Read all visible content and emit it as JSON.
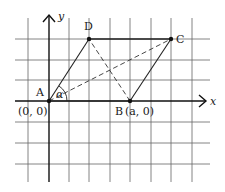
{
  "diagram": {
    "type": "parallelogram-on-coordinate-grid",
    "axes": {
      "x_label": "x",
      "y_label": "y"
    },
    "points": {
      "A": {
        "name": "A",
        "coord_label": "(0, 0)"
      },
      "B": {
        "name": "B",
        "coord_label": "(a, 0)"
      },
      "C": {
        "name": "C"
      },
      "D": {
        "name": "D"
      }
    },
    "angle_label": "α",
    "edges_solid": [
      "AB",
      "BC",
      "CD",
      "DA"
    ],
    "edges_dashed": [
      "AC",
      "BD"
    ],
    "colors": {
      "grid": "#555555",
      "axis": "#111111",
      "figure": "#222222",
      "background": "#ffffff"
    }
  }
}
